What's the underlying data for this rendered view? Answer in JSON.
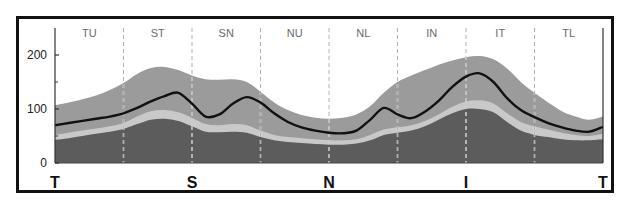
{
  "chart_data": {
    "type": "area",
    "title": "",
    "xlabel": "",
    "ylabel": "",
    "ylim": [
      0,
      250
    ],
    "yticks": [
      0,
      100,
      200
    ],
    "minor_yticks": [
      50,
      150
    ],
    "sector_labels": [
      "TU",
      "ST",
      "SN",
      "NU",
      "NL",
      "IN",
      "IT",
      "TL"
    ],
    "bottom_labels": [
      "T",
      "S",
      "N",
      "I",
      "T"
    ],
    "x": [
      0,
      10,
      20,
      30,
      40,
      50,
      60,
      70,
      80,
      90,
      100,
      110,
      120,
      130,
      140,
      150,
      160,
      170,
      180,
      190,
      200,
      210,
      220,
      230,
      240,
      250,
      260,
      270,
      280,
      290,
      300,
      310,
      320,
      330,
      340,
      350,
      360,
      370,
      380,
      390,
      400
    ],
    "x_note": "position along circumference, 0-400 spans T-S-N-I-T; sector width 50",
    "series": [
      {
        "name": "upper-normal-limit",
        "color": "#9b9b9b",
        "values": [
          107,
          112,
          118,
          125,
          135,
          148,
          165,
          176,
          178,
          172,
          162,
          155,
          154,
          155,
          150,
          132,
          112,
          98,
          89,
          84,
          82,
          84,
          90,
          105,
          130,
          150,
          162,
          172,
          182,
          190,
          196,
          198,
          192,
          175,
          150,
          130,
          112,
          96,
          86,
          80,
          86
        ]
      },
      {
        "name": "patient-measurement",
        "color": "#111111",
        "values": [
          70,
          74,
          78,
          82,
          86,
          92,
          102,
          114,
          124,
          130,
          110,
          86,
          90,
          110,
          122,
          112,
          92,
          76,
          66,
          60,
          56,
          55,
          60,
          80,
          102,
          90,
          83,
          95,
          115,
          141,
          160,
          166,
          150,
          120,
          98,
          85,
          74,
          66,
          60,
          58,
          67
        ]
      },
      {
        "name": "lower-normal-limit",
        "color": "#c9c9c9",
        "values": [
          52,
          56,
          60,
          64,
          68,
          74,
          86,
          96,
          98,
          94,
          84,
          72,
          70,
          72,
          70,
          60,
          52,
          48,
          46,
          44,
          42,
          42,
          44,
          52,
          62,
          66,
          70,
          78,
          90,
          104,
          114,
          116,
          110,
          92,
          76,
          68,
          62,
          56,
          52,
          50,
          54
        ]
      },
      {
        "name": "borderline-limit",
        "color": "#5c5c5c",
        "values": [
          43,
          46,
          50,
          54,
          58,
          63,
          72,
          80,
          82,
          78,
          68,
          58,
          57,
          58,
          56,
          48,
          42,
          39,
          37,
          35,
          34,
          34,
          36,
          42,
          52,
          56,
          60,
          68,
          80,
          92,
          100,
          100,
          94,
          76,
          60,
          52,
          48,
          44,
          42,
          42,
          44
        ]
      }
    ],
    "grid": false,
    "legend": null
  },
  "colors": {
    "frame": "#111111",
    "axis": "#333333",
    "divider": "#ffffff",
    "label_text": "#6a6a6a"
  }
}
